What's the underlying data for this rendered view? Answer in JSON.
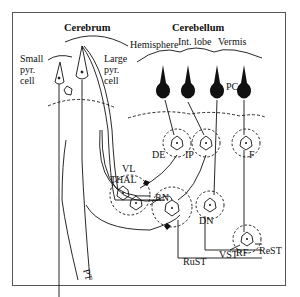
{
  "diagram": {
    "headings": {
      "cerebrum": "Cerebrum",
      "cerebellum": "Cerebellum"
    },
    "cerebellum_regions": [
      "Hemisphere",
      "Int. lobe",
      "Vermis"
    ],
    "cerebrum_labels": {
      "small_pyr_1": "Small",
      "small_pyr_2": "pyr.",
      "small_pyr_3": "cell",
      "large_pyr_1": "Large",
      "large_pyr_2": "pyr.",
      "large_pyr_3": "cell"
    },
    "nuclei": {
      "pc": "PC",
      "de": "DE",
      "ip": "IP",
      "f": "F",
      "vl": "VL",
      "thal": "THAL",
      "rn": "RN",
      "dn": "DN",
      "rf": "RF",
      "pt": "PT"
    },
    "tracts": {
      "rust": "RuST",
      "vst": "VST",
      "rest": "ReST"
    }
  }
}
